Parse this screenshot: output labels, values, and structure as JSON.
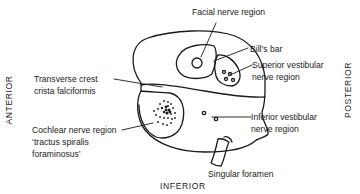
{
  "diagram": {
    "orientation": {
      "anterior": "ANTERIOR",
      "posterior": "POSTERIOR",
      "inferior": "INFERIOR"
    },
    "labels": {
      "facial_nerve": "Facial nerve region",
      "bills_bar": "Bill’s bar",
      "superior_vestibular_1": "Superior vestibular",
      "superior_vestibular_2": "nerve region",
      "transverse_crest_1": "Transverse crest",
      "transverse_crest_2": "crista falciformis",
      "cochlear_1": "Cochlear nerve region",
      "cochlear_2": "‘tractus spiralis",
      "cochlear_3": "foraminosus’",
      "inferior_vestibular_1": "Inferior vestibular",
      "inferior_vestibular_2": "nerve region",
      "singular_foramen": "Singular foramen"
    },
    "line_color": "#1a1a1a"
  }
}
